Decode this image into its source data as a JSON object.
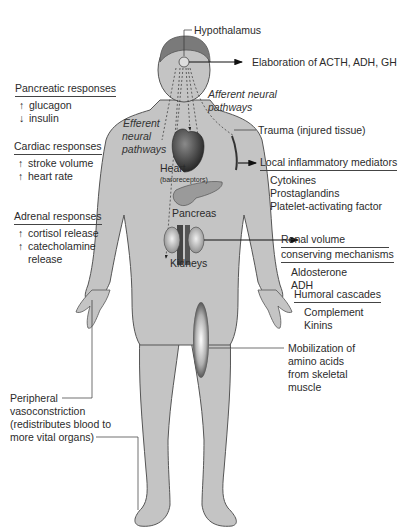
{
  "diagram": {
    "labels": {
      "hypothalamus": "Hypothalamus",
      "elaboration": "Elaboration of ACTH, ADH, GH",
      "afferent_1": "Afferent neural",
      "afferent_2": "pathways",
      "efferent_1": "Efferent",
      "efferent_2": "neural",
      "efferent_3": "pathways",
      "trauma": "Trauma (injured tissue)",
      "heart": "Heart",
      "baroreceptors": "(baroreceptors)",
      "pancreas": "Pancreas",
      "kidneys": "Kidneys"
    },
    "pancreatic": {
      "header": "Pancreatic responses",
      "items": [
        {
          "arrow": "↑",
          "text": "glucagon"
        },
        {
          "arrow": "↓",
          "text": "insulin"
        }
      ]
    },
    "cardiac": {
      "header": "Cardiac responses",
      "items": [
        {
          "arrow": "↑",
          "text": "stroke volume"
        },
        {
          "arrow": "↑",
          "text": "heart rate"
        }
      ]
    },
    "adrenal": {
      "header": "Adrenal responses",
      "items": [
        {
          "arrow": "↑",
          "text": "cortisol release"
        },
        {
          "arrow": "↑",
          "text": "catecholamine"
        },
        {
          "arrow": "",
          "text": "release"
        }
      ]
    },
    "inflammatory": {
      "header": "Local inflammatory mediators",
      "items": [
        "Cytokines",
        "Prostaglandins",
        "Platelet-activating factor"
      ]
    },
    "renal": {
      "header_1": "Renal volume",
      "header_2": "conserving mechanisms",
      "items": [
        "Aldosterone",
        "ADH"
      ]
    },
    "humoral": {
      "header": "Humoral cascades",
      "items": [
        "Complement",
        "Kinins"
      ]
    },
    "muscle": {
      "lines": [
        "Mobilization of",
        "amino acids",
        "from skeletal",
        "muscle"
      ]
    },
    "peripheral": {
      "lines": [
        "Peripheral",
        "vasoconstriction",
        "(redistributes blood to",
        "more vital organs)"
      ]
    },
    "colors": {
      "body_fill": "#c4c4c4",
      "body_outline": "#555555",
      "hair": "#7a7a7a",
      "text": "#2b2b2b",
      "organ_dark": "#3a3a3a"
    }
  }
}
